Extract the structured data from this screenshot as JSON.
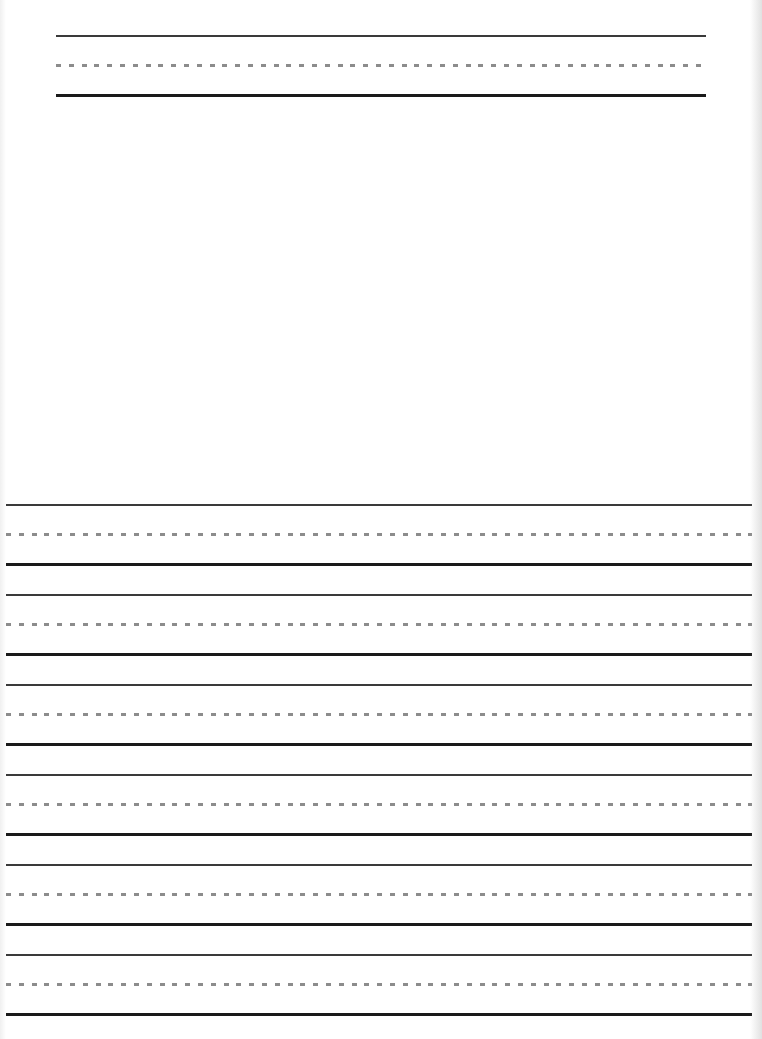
{
  "page": {
    "type": "handwriting-practice-sheet",
    "title_line_set": {
      "rows": 1,
      "left": 56,
      "right": 706,
      "top": 35
    },
    "drawing_area": {
      "label": ""
    },
    "writing_lines": {
      "rows": 6,
      "left": 6,
      "right": 752,
      "first_top": 504,
      "row_pitch": 90
    },
    "colors": {
      "solid_line": "#1a1a1a",
      "top_line": "#3a3a3a",
      "dashed_midline": "#8c8c8c",
      "paper": "#ffffff"
    }
  }
}
